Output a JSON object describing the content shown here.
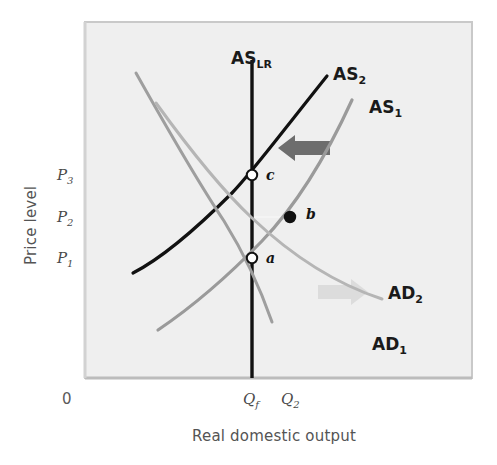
{
  "figure": {
    "background_color": "#ffffff",
    "plot_background_color": "#efefef",
    "plot_border_color": "#c9c9c9"
  },
  "axes": {
    "y_title": "Price level",
    "x_title": "Real domestic output",
    "origin_label": "0",
    "y_ticks": [
      {
        "base": "P",
        "sub": "3",
        "value_y": 175
      },
      {
        "base": "P",
        "sub": "2",
        "value_y": 217
      },
      {
        "base": "P",
        "sub": "1",
        "value_y": 258
      }
    ],
    "x_ticks": [
      {
        "base": "Q",
        "sub": "f",
        "value_x": 252
      },
      {
        "base": "Q",
        "sub": "2",
        "value_x": 290
      }
    ]
  },
  "chart_data": {
    "type": "line",
    "title": "",
    "xlabel": "Real domestic output",
    "ylabel": "Price level",
    "grid": false,
    "legend": "inline-curve-labels",
    "series": [
      {
        "name": "AS_LR",
        "label_base": "AS",
        "label_sub": "LR",
        "kind": "vertical-line",
        "color": "#111111",
        "width": 3.4,
        "x": 252,
        "y_top": 60,
        "y_bottom": 378,
        "label_x": 231,
        "label_y": 64
      },
      {
        "name": "AS_2",
        "label_base": "AS",
        "label_sub": "2",
        "kind": "upward-curve",
        "color": "#111111",
        "width": 3.2,
        "path": "M133,273 C168,255 205,220 232,193 C250,175 275,141 327,76",
        "label_x": 333,
        "label_y": 80
      },
      {
        "name": "AS_1",
        "label_base": "AS",
        "label_sub": "1",
        "kind": "upward-curve",
        "color": "#9a9a9a",
        "width": 3.2,
        "path": "M158,330 C195,305 232,272 262,241 C288,214 320,170 352,100",
        "label_x": 369,
        "label_y": 113
      },
      {
        "name": "AD_1",
        "label_base": "AD",
        "label_sub": "1",
        "kind": "downward-curve",
        "color": "#9e9e9e",
        "width": 3.0,
        "path": "M136,73 C168,130 198,182 224,221 C242,250 258,282 272,322",
        "label_x": 372,
        "label_y": 350
      },
      {
        "name": "AD_2",
        "label_base": "AD",
        "label_sub": "2",
        "kind": "downward-curve",
        "color": "#b5b5b5",
        "width": 3.0,
        "path": "M156,103 C190,150 222,190 252,218 C288,252 330,282 382,299",
        "label_x": 388,
        "label_y": 299
      }
    ],
    "points": [
      {
        "name": "a",
        "label": "a",
        "x": 252,
        "y": 258,
        "style": "hollow",
        "fill": "#ffffff",
        "stroke": "#111111",
        "label_x": 266,
        "label_y": 263
      },
      {
        "name": "b",
        "label": "b",
        "x": 290,
        "y": 217,
        "style": "solid",
        "fill": "#111111",
        "stroke": "#111111",
        "label_x": 306,
        "label_y": 219
      },
      {
        "name": "c",
        "label": "c",
        "x": 252,
        "y": 175,
        "style": "hollow",
        "fill": "#ffffff",
        "stroke": "#111111",
        "label_x": 266,
        "label_y": 180
      }
    ],
    "annotations": [
      {
        "name": "as-shift-arrow",
        "direction": "left",
        "color": "#6d6d6d",
        "x": 278,
        "y": 148,
        "length": 52
      },
      {
        "name": "ad-shift-arrow",
        "direction": "right",
        "color": "#dcdcdc",
        "x": 318,
        "y": 292,
        "length": 50
      }
    ],
    "guide_lines": [
      {
        "name": "p2-guide",
        "from_x": 252,
        "to_x": 290,
        "y": 217,
        "color": "#f4f4f4"
      }
    ]
  }
}
